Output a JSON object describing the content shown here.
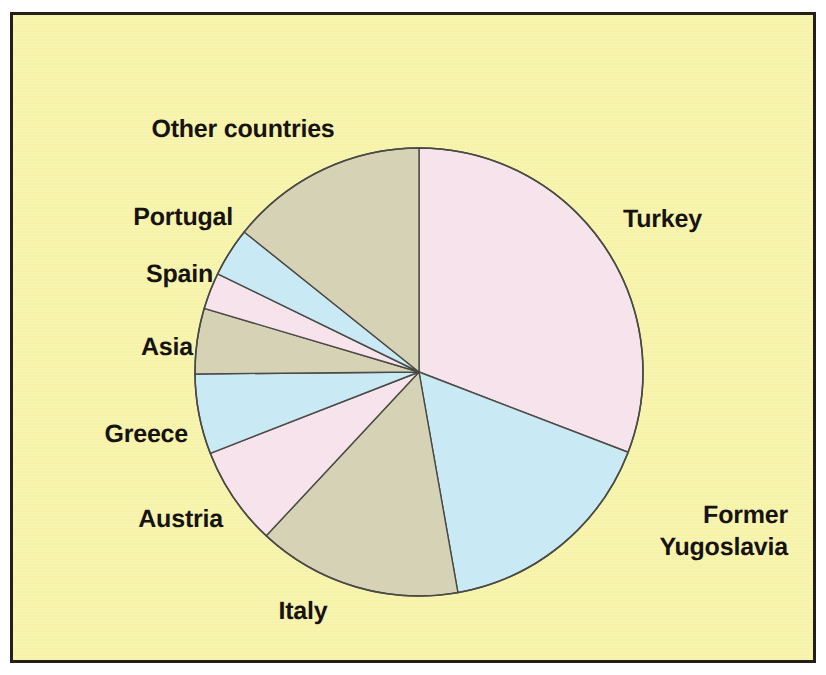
{
  "figure": {
    "background_color": "#f6f2a6",
    "border_color": "#231f1a"
  },
  "chart_data": {
    "type": "pie",
    "title": "",
    "subtitle": "",
    "xlabel": "",
    "ylabel": "",
    "grid": false,
    "legend_position": "outside-labels",
    "start_angle_deg_from_12oclock": 0,
    "direction": "clockwise",
    "categories": [
      "Turkey",
      "Former Yugoslavia",
      "Italy",
      "Austria",
      "Greece",
      "Asia",
      "Spain",
      "Portugal",
      "Other countries"
    ],
    "values": [
      30.8,
      16.4,
      14.7,
      7.1,
      5.8,
      4.7,
      2.6,
      3.5,
      14.4
    ],
    "units": "percent",
    "slices": [
      {
        "label": "Turkey",
        "value": 30.8,
        "start_deg": 0.0,
        "end_deg": 111.0,
        "color": "#f7e3ec"
      },
      {
        "label": "Former Yugoslavia",
        "value": 16.4,
        "start_deg": 111.0,
        "end_deg": 170.0,
        "color": "#c9e9f5"
      },
      {
        "label": "Italy",
        "value": 14.7,
        "start_deg": 170.0,
        "end_deg": 223.0,
        "color": "#d6d2b6"
      },
      {
        "label": "Austria",
        "value": 7.1,
        "start_deg": 223.0,
        "end_deg": 248.7,
        "color": "#f7e3ec"
      },
      {
        "label": "Greece",
        "value": 5.8,
        "start_deg": 248.7,
        "end_deg": 269.5,
        "color": "#c9e9f5"
      },
      {
        "label": "Asia",
        "value": 4.7,
        "start_deg": 269.5,
        "end_deg": 286.5,
        "color": "#d6d2b6"
      },
      {
        "label": "Spain",
        "value": 2.6,
        "start_deg": 286.5,
        "end_deg": 296.0,
        "color": "#f7e3ec"
      },
      {
        "label": "Portugal",
        "value": 3.5,
        "start_deg": 296.0,
        "end_deg": 308.7,
        "color": "#c9e9f5"
      },
      {
        "label": "Other countries",
        "value": 14.4,
        "start_deg": 308.7,
        "end_deg": 360.0,
        "color": "#d6d2b6"
      }
    ],
    "slice_outline_color": "#4a4a44",
    "annotations": []
  },
  "labels": {
    "other_countries": "Other countries",
    "portugal": "Portugal",
    "spain": "Spain",
    "asia": "Asia",
    "greece": "Greece",
    "austria": "Austria",
    "italy": "Italy",
    "turkey": "Turkey",
    "former_yugoslavia_line1": "Former",
    "former_yugoslavia_line2": "Yugoslavia"
  }
}
